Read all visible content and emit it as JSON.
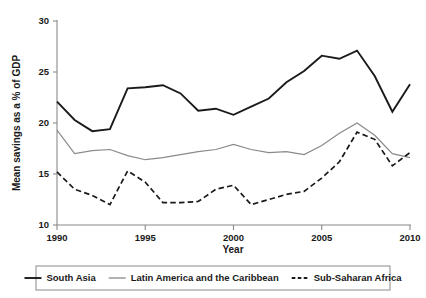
{
  "chart_data": {
    "type": "line",
    "title": "",
    "xlabel": "Year",
    "ylabel": "Mean savings as a % of GDP",
    "xlim": [
      1990,
      2010
    ],
    "ylim": [
      10,
      30
    ],
    "grid": false,
    "legend_position": "bottom",
    "x": [
      1990,
      1991,
      1992,
      1993,
      1994,
      1995,
      1996,
      1997,
      1998,
      1999,
      2000,
      2001,
      2002,
      2003,
      2004,
      2005,
      2006,
      2007,
      2008,
      2009,
      2010
    ],
    "xticks": [
      1990,
      1995,
      2000,
      2005,
      2010
    ],
    "xtick_labels": [
      "1990",
      "1995",
      "2000",
      "2005",
      "2010"
    ],
    "yticks": [
      10,
      15,
      20,
      25,
      30
    ],
    "ytick_labels": [
      "10",
      "15",
      "20",
      "25",
      "30"
    ],
    "series": [
      {
        "name": "South Asia",
        "style": "solid",
        "color": "#1a1a1a",
        "width": 1.9,
        "values": [
          22.1,
          20.3,
          19.2,
          19.4,
          23.4,
          23.5,
          23.7,
          22.9,
          21.2,
          21.4,
          20.8,
          21.6,
          22.4,
          24.0,
          25.1,
          26.6,
          26.3,
          27.1,
          24.6,
          21.1,
          23.8
        ]
      },
      {
        "name": "Latin America and the Caribbean",
        "style": "solid",
        "color": "#8a8a8a",
        "width": 1.2,
        "values": [
          19.3,
          17.0,
          17.3,
          17.4,
          16.8,
          16.4,
          16.6,
          16.9,
          17.2,
          17.4,
          17.9,
          17.4,
          17.1,
          17.2,
          16.9,
          17.8,
          19.0,
          20.0,
          18.8,
          17.0,
          16.6
        ]
      },
      {
        "name": "Sub-Saharan Africa",
        "style": "dashed",
        "color": "#1a1a1a",
        "width": 1.7,
        "values": [
          15.2,
          13.5,
          12.9,
          12.0,
          15.3,
          14.2,
          12.2,
          12.2,
          12.3,
          13.5,
          13.9,
          12.0,
          12.5,
          13.0,
          13.3,
          14.6,
          16.2,
          19.1,
          18.4,
          15.8,
          17.1
        ]
      }
    ]
  },
  "legend": {
    "entries": [
      {
        "label": "South Asia",
        "style": "solid",
        "color": "#1a1a1a"
      },
      {
        "label": "Latin America and the Caribbean",
        "style": "solid",
        "color": "#8a8a8a"
      },
      {
        "label": "Sub-Saharan Africa",
        "style": "dashed",
        "color": "#1a1a1a"
      }
    ]
  }
}
